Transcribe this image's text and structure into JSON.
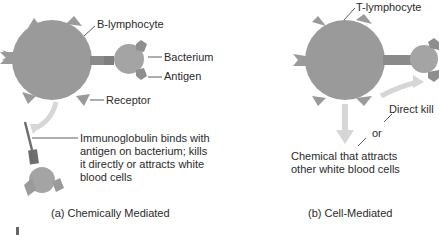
{
  "panel_a": {
    "cell_label": "B-lymphocyte",
    "bacterium_label": "Bacterium",
    "antigen_label": "Antigen",
    "receptor_label": "Receptor",
    "immunoglobulin_lines": [
      "Immunoglobulin binds with",
      "antigen on bacterium; kills",
      "it directly or attracts white",
      "blood cells"
    ],
    "caption": "(a) Chemically Mediated"
  },
  "panel_b": {
    "cell_label": "T-lymphocyte",
    "direct_kill_label": "Direct kill",
    "or_label": "or",
    "chemical_lines": [
      "Chemical that attracts",
      "other white blood cells"
    ],
    "caption": "(b) Cell-Mediated"
  },
  "colors": {
    "cell_fill": "#9a9a9a",
    "bacterium_fill": "#a4a4a4",
    "antigen_fill": "#8e8e8e",
    "receptor_stem": "#7e7e7e",
    "arrow_fill": "#d6d6d6",
    "immunoglobulin_dark": "#6e6e6e",
    "leader_line": "#333333"
  }
}
